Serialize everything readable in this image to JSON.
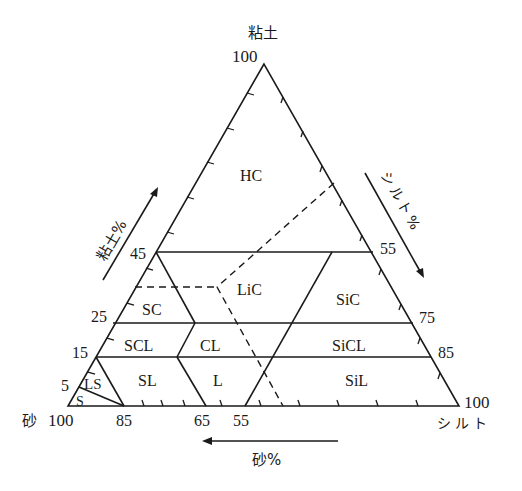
{
  "diagram": {
    "type": "soil-texture-triangle",
    "vertices": {
      "top": {
        "label": "粘土",
        "value": "100"
      },
      "bottom_left": {
        "label": "砂",
        "value": "100"
      },
      "bottom_right": {
        "label": "シルト",
        "value": "100"
      }
    },
    "axes": {
      "clay": {
        "label": "粘土%",
        "ticks": [
          "45",
          "25",
          "15",
          "5"
        ]
      },
      "silt": {
        "label": "シルト%",
        "ticks": [
          "55",
          "75",
          "85"
        ]
      },
      "sand": {
        "label": "砂%",
        "ticks": [
          "85",
          "65",
          "55"
        ]
      }
    },
    "regions": [
      {
        "code": "HC"
      },
      {
        "code": "LiC"
      },
      {
        "code": "SC"
      },
      {
        "code": "SiC"
      },
      {
        "code": "SCL"
      },
      {
        "code": "CL"
      },
      {
        "code": "SiCL"
      },
      {
        "code": "SL"
      },
      {
        "code": "L"
      },
      {
        "code": "SiL"
      },
      {
        "code": "LS"
      },
      {
        "code": "S"
      }
    ]
  }
}
